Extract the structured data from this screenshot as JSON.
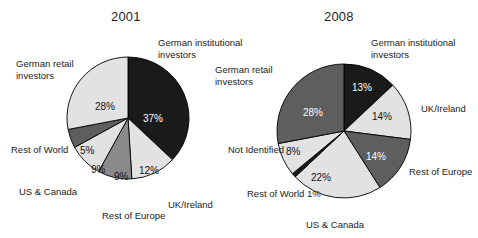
{
  "figure": {
    "caption": "",
    "background": "#ffffff"
  },
  "palette": {
    "black": "#1a1a1a",
    "dark_gray": "#5e5e5e",
    "mid_gray": "#8a8a8a",
    "light_gray": "#e2e2e2",
    "outline": "#000000",
    "text": "#1c1c1c",
    "text_on_dark": "#ffffff"
  },
  "charts": [
    {
      "id": "chart-2001",
      "title": "2001",
      "center": {
        "x": 128,
        "y": 118
      },
      "radius": 61,
      "start_angle_deg": 0,
      "slices": [
        {
          "label": "German institutional investors",
          "value": 37,
          "value_label": "37%",
          "color": "black",
          "label_side": "right",
          "label_x": 158,
          "label_y": 37,
          "value_x": 143,
          "value_y": 114,
          "on_dark": true
        },
        {
          "label": "UK/Ireland",
          "value": 12,
          "value_label": "12%",
          "color": "light_gray",
          "label_side": "right",
          "label_x": 168,
          "label_y": 199,
          "value_x": 139,
          "value_y": 166,
          "on_dark": false
        },
        {
          "label": "Rest of Europe",
          "value": 9,
          "value_label": "9%",
          "color": "mid_gray",
          "label_side": "center",
          "label_x": 102,
          "label_y": 210,
          "value_x": 114,
          "value_y": 172,
          "on_dark": false
        },
        {
          "label": "US & Canada",
          "value": 9,
          "value_label": "9%",
          "color": "light_gray",
          "label_side": "left",
          "label_x": 19,
          "label_y": 186,
          "value_x": 91,
          "value_y": 165,
          "on_dark": false
        },
        {
          "label": "Rest of World",
          "value": 5,
          "value_label": "5%",
          "color": "dark_gray",
          "label_side": "left",
          "label_x": 11,
          "label_y": 144,
          "value_x": 80,
          "value_y": 146,
          "on_dark": false
        },
        {
          "label": "German retail investors",
          "value": 28,
          "value_label": "28%",
          "color": "light_gray",
          "label_side": "left",
          "label_x": 16,
          "label_y": 58,
          "value_x": 95,
          "value_y": 102,
          "on_dark": false
        }
      ]
    },
    {
      "id": "chart-2008",
      "title": "2008",
      "center": {
        "x": 344,
        "y": 131
      },
      "radius": 67,
      "start_angle_deg": 0,
      "slices": [
        {
          "label": "German institutional investors",
          "value": 13,
          "value_label": "13%",
          "color": "black",
          "label_side": "right",
          "label_x": 371,
          "label_y": 37,
          "value_x": 352,
          "value_y": 83,
          "on_dark": true
        },
        {
          "label": "UK/Ireland",
          "value": 14,
          "value_label": "14%",
          "color": "light_gray",
          "label_side": "right",
          "label_x": 421,
          "label_y": 103,
          "value_x": 372,
          "value_y": 112,
          "on_dark": false
        },
        {
          "label": "Rest of Europe",
          "value": 14,
          "value_label": "14%",
          "color": "dark_gray",
          "label_side": "right",
          "label_x": 409,
          "label_y": 166,
          "value_x": 366,
          "value_y": 152,
          "on_dark": true
        },
        {
          "label": "US & Canada",
          "value": 22,
          "value_label": "22%",
          "color": "light_gray",
          "label_side": "center",
          "label_x": 306,
          "label_y": 219,
          "value_x": 311,
          "value_y": 173,
          "on_dark": false
        },
        {
          "label": "Rest of World 1%",
          "value": 1,
          "value_label": "",
          "color": "black",
          "label_side": "left",
          "label_x": 247,
          "label_y": 188,
          "value_x": 0,
          "value_y": 0,
          "on_dark": true
        },
        {
          "label": "Not Identified",
          "value": 8,
          "value_label": "8%",
          "color": "light_gray",
          "label_side": "left",
          "label_x": 228,
          "label_y": 144,
          "value_x": 286,
          "value_y": 147,
          "on_dark": false
        },
        {
          "label": "German retail investors",
          "value": 28,
          "value_label": "28%",
          "color": "dark_gray",
          "label_side": "left",
          "label_x": 215,
          "label_y": 64,
          "value_x": 303,
          "value_y": 108,
          "on_dark": true
        }
      ]
    }
  ],
  "chart_data": [
    {
      "type": "pie",
      "title": "2001",
      "xlabel": "",
      "ylabel": "",
      "categories": [
        "German institutional investors",
        "UK/Ireland",
        "Rest of Europe",
        "US & Canada",
        "Rest of World",
        "German retail investors"
      ],
      "values": [
        37,
        12,
        9,
        9,
        5,
        28
      ],
      "value_labels": [
        "37%",
        "12%",
        "9%",
        "9%",
        "5%",
        "28%"
      ],
      "colors": [
        "#1a1a1a",
        "#e2e2e2",
        "#8a8a8a",
        "#e2e2e2",
        "#5e5e5e",
        "#e2e2e2"
      ],
      "units": "percent",
      "total": 100,
      "start_angle_deg": 0,
      "direction": "clockwise",
      "legend": "none",
      "grid": false,
      "labels_placement": "callout-outside-with-value-inside"
    },
    {
      "type": "pie",
      "title": "2008",
      "xlabel": "",
      "ylabel": "",
      "categories": [
        "German institutional investors",
        "UK/Ireland",
        "Rest of Europe",
        "US & Canada",
        "Rest of World",
        "Not Identified",
        "German retail investors"
      ],
      "values": [
        13,
        14,
        14,
        22,
        1,
        8,
        28
      ],
      "value_labels": [
        "13%",
        "14%",
        "14%",
        "22%",
        "1%",
        "8%",
        "28%"
      ],
      "colors": [
        "#1a1a1a",
        "#e2e2e2",
        "#5e5e5e",
        "#e2e2e2",
        "#1a1a1a",
        "#e2e2e2",
        "#5e5e5e"
      ],
      "units": "percent",
      "total": 100,
      "start_angle_deg": 0,
      "direction": "clockwise",
      "legend": "none",
      "grid": false,
      "labels_placement": "callout-outside-with-value-inside"
    }
  ]
}
